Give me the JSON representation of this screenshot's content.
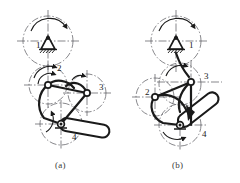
{
  "figure": {
    "line_color": "#1a1a1a",
    "centerline_color": "#55555a",
    "background": "#ffffff"
  },
  "captions": {
    "a": "(a)",
    "b": "(b)"
  },
  "diagram_a": {
    "name": "mechanism-diagram-a",
    "labels": [
      {
        "id": "a-label-1",
        "text": "1",
        "x": 36,
        "y": 44
      },
      {
        "id": "a-label-2",
        "text": "2",
        "x": 57,
        "y": 69
      },
      {
        "id": "a-label-3",
        "text": "3",
        "x": 99,
        "y": 88
      },
      {
        "id": "a-label-4",
        "text": "4",
        "x": 72,
        "y": 137
      }
    ],
    "joints": [
      {
        "id": "a-joint-ground",
        "type": "fixed-pivot",
        "x": 48,
        "y": 41
      },
      {
        "id": "a-joint-2",
        "type": "pin",
        "x": 48,
        "y": 85
      },
      {
        "id": "a-joint-3",
        "type": "pin",
        "x": 87,
        "y": 93
      },
      {
        "id": "a-joint-4",
        "type": "pin-double",
        "x": 61,
        "y": 124
      }
    ],
    "circles": [
      {
        "id": "a-circle-1",
        "cx": 48,
        "cy": 41,
        "r": 25
      },
      {
        "id": "a-circle-2",
        "cx": 48,
        "cy": 85,
        "r": 19
      },
      {
        "id": "a-circle-3",
        "cx": 87,
        "cy": 93,
        "r": 19
      },
      {
        "id": "a-circle-4",
        "cx": 61,
        "cy": 124,
        "r": 21
      }
    ],
    "slider": {
      "id": "a-handle",
      "x": 61,
      "y": 124,
      "angle": 12,
      "length": 48,
      "width": 13
    }
  },
  "diagram_b": {
    "name": "mechanism-diagram-b",
    "labels": [
      {
        "id": "b-label-1",
        "text": "1",
        "x": 189,
        "y": 44
      },
      {
        "id": "b-label-2",
        "text": "2",
        "x": 145,
        "y": 92
      },
      {
        "id": "b-label-3",
        "text": "3",
        "x": 204,
        "y": 76
      },
      {
        "id": "b-label-4",
        "text": "4",
        "x": 202,
        "y": 134
      }
    ],
    "joints": [
      {
        "id": "b-joint-ground",
        "type": "fixed-pivot",
        "x": 176,
        "y": 41
      },
      {
        "id": "b-joint-3",
        "type": "pin",
        "x": 191,
        "y": 82
      },
      {
        "id": "b-joint-2",
        "type": "pin",
        "x": 155,
        "y": 97
      },
      {
        "id": "b-joint-4",
        "type": "pin-double",
        "x": 180,
        "y": 125
      }
    ],
    "circles": [
      {
        "id": "b-circle-1",
        "cx": 176,
        "cy": 41,
        "r": 25
      },
      {
        "id": "b-circle-3",
        "cx": 180,
        "cy": 84,
        "r": 21
      },
      {
        "id": "b-circle-2",
        "cx": 155,
        "cy": 97,
        "r": 19
      },
      {
        "id": "b-circle-4",
        "cx": 180,
        "cy": 125,
        "r": 21
      }
    ],
    "slider": {
      "id": "b-handle",
      "x": 180,
      "y": 125,
      "angle": -38,
      "length": 46,
      "width": 13
    }
  }
}
